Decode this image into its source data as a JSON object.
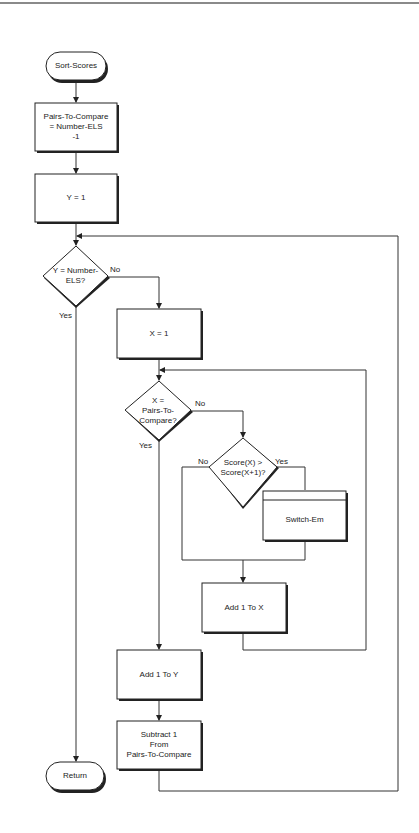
{
  "diagram": {
    "type": "flowchart",
    "title": "Sort-Scores",
    "nodes": {
      "start": {
        "shape": "terminal",
        "label": "Sort-Scores"
      },
      "init_pairs": {
        "shape": "process",
        "label": "Pairs-To-Compare\n= Number-ELS\n-1"
      },
      "init_y": {
        "shape": "process",
        "label": "Y = 1"
      },
      "cond_y": {
        "shape": "decision",
        "label": "Y = Number-\nELS?"
      },
      "init_x": {
        "shape": "process",
        "label": "X = 1"
      },
      "cond_x": {
        "shape": "decision",
        "label": "X =\nPairs-To-\nCompare?"
      },
      "cond_score": {
        "shape": "decision",
        "label": "Score(X) >\nScore(X+1)?"
      },
      "switch": {
        "shape": "predefined-process",
        "label": "Switch-Em"
      },
      "inc_x": {
        "shape": "process",
        "label": "Add 1 To X"
      },
      "inc_y": {
        "shape": "process",
        "label": "Add 1 To Y"
      },
      "dec_pairs": {
        "shape": "process",
        "label": "Subtract 1\nFrom\nPairs-To-Compare"
      },
      "end": {
        "shape": "terminal",
        "label": "Return"
      }
    },
    "edge_labels": {
      "cond_y_no": "No",
      "cond_y_yes": "Yes",
      "cond_x_no": "No",
      "cond_x_yes": "Yes",
      "cond_score_no": "No",
      "cond_score_yes": "Yes"
    },
    "edges": [
      {
        "from": "start",
        "to": "init_pairs"
      },
      {
        "from": "init_pairs",
        "to": "init_y"
      },
      {
        "from": "init_y",
        "to": "cond_y"
      },
      {
        "from": "cond_y",
        "to": "init_x",
        "label": "No"
      },
      {
        "from": "cond_y",
        "to": "end",
        "label": "Yes"
      },
      {
        "from": "init_x",
        "to": "cond_x"
      },
      {
        "from": "cond_x",
        "to": "cond_score",
        "label": "No"
      },
      {
        "from": "cond_x",
        "to": "inc_y",
        "label": "Yes"
      },
      {
        "from": "cond_score",
        "to": "switch",
        "label": "Yes"
      },
      {
        "from": "cond_score",
        "to": "inc_x",
        "label": "No"
      },
      {
        "from": "switch",
        "to": "inc_x"
      },
      {
        "from": "inc_x",
        "to": "cond_x"
      },
      {
        "from": "inc_y",
        "to": "dec_pairs"
      },
      {
        "from": "dec_pairs",
        "to": "cond_y"
      }
    ]
  }
}
